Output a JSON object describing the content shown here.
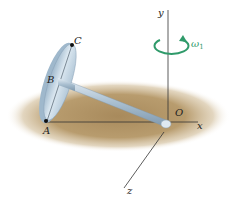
{
  "diagram": {
    "type": "3D rigid body dynamics figure",
    "points": [
      {
        "id": "C",
        "label": "C"
      },
      {
        "id": "B",
        "label": "B"
      },
      {
        "id": "A",
        "label": "A"
      },
      {
        "id": "O",
        "label": "O"
      }
    ],
    "axes": [
      {
        "id": "x",
        "label": "x"
      },
      {
        "id": "y",
        "label": "y"
      },
      {
        "id": "z",
        "label": "z"
      }
    ],
    "angular_velocity": {
      "symbol": "ω",
      "subscript": "1",
      "axis": "y",
      "color": "#2f9a6a"
    },
    "colors": {
      "ground": "#b89c6e",
      "disk_face": "#c9dbe8",
      "disk_rim": "#9fb8cc",
      "rod": "#a9bfd0",
      "axis_lines": "#333333"
    }
  }
}
